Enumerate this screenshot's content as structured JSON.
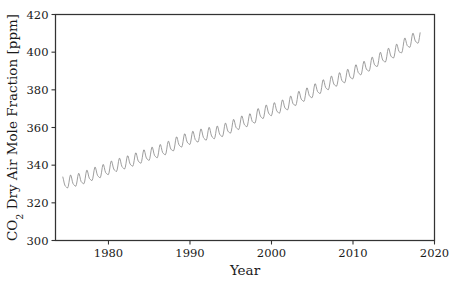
{
  "figure": {
    "background_color": "#ffffff",
    "frame_color": "#333333",
    "line_color": "#8c8c8c"
  },
  "axes": {
    "xlabel": "Year",
    "ylabel_prefix": "CO",
    "ylabel_subscript": "2",
    "ylabel_rest": " Dry Air Mole Fraction [ppm]",
    "ylabel_full": "CO2 Dry Air Mole Fraction [ppm]",
    "xticks": [
      "1980",
      "1990",
      "2000",
      "2010",
      "2020"
    ],
    "yticks": [
      "300",
      "320",
      "340",
      "360",
      "380",
      "400",
      "420"
    ]
  },
  "chart_data": {
    "type": "line",
    "title": "",
    "xlabel": "Year",
    "ylabel": "CO2 Dry Air Mole Fraction [ppm]",
    "xlim": [
      1973.5,
      2020.0
    ],
    "ylim": [
      300,
      420
    ],
    "xticks": [
      1980,
      1990,
      2000,
      2010,
      2020
    ],
    "yticks": [
      300,
      320,
      340,
      360,
      380,
      400,
      420
    ],
    "grid": false,
    "legend": false,
    "series": [
      {
        "name": "Monthly mean CO2 dry air mole fraction",
        "description": "Monthly mean atmospheric CO2 with rising trend plus seasonal cycle (peak ~May, trough ~September), amplitude about 6 ppm peak-to-trough",
        "x_units": "year",
        "y_units": "ppm",
        "x_start": 1974.4,
        "x_end": 2018.3,
        "annual_means": {
          "1974": 330.2,
          "1975": 331.1,
          "1976": 332.0,
          "1977": 333.8,
          "1978": 335.4,
          "1979": 336.8,
          "1980": 338.7,
          "1981": 340.1,
          "1982": 341.4,
          "1983": 343.0,
          "1984": 344.6,
          "1985": 346.0,
          "1986": 347.4,
          "1987": 349.2,
          "1988": 351.6,
          "1989": 353.1,
          "1990": 354.4,
          "1991": 355.6,
          "1992": 356.4,
          "1993": 357.1,
          "1994": 358.8,
          "1995": 360.8,
          "1996": 362.6,
          "1997": 363.7,
          "1998": 366.7,
          "1999": 368.4,
          "2000": 369.6,
          "2001": 371.1,
          "2002": 373.2,
          "2003": 375.8,
          "2004": 377.5,
          "2005": 379.8,
          "2006": 381.9,
          "2007": 383.8,
          "2008": 385.6,
          "2009": 387.4,
          "2010": 389.9,
          "2011": 391.6,
          "2012": 393.9,
          "2013": 396.5,
          "2014": 398.6,
          "2015": 400.8,
          "2016": 404.2,
          "2017": 406.6,
          "2018": 408.5
        },
        "seasonal_amplitude_ppm": 6.2,
        "seasonal_peak_month": 5,
        "seasonal_trough_month": 9
      }
    ]
  }
}
